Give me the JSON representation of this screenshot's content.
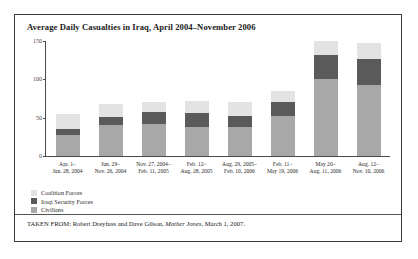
{
  "figure": {
    "title": "Average Daily Casualties in Iraq, April 2004–November 2006",
    "source_prefix": "TAKEN FROM: Robert Dreyfuss and Dave Gilson, ",
    "source_italic": "Mother Jones",
    "source_suffix": ", March 1, 2007."
  },
  "chart_data": {
    "type": "bar",
    "stacked": true,
    "title": "Average Daily Casualties in Iraq, April 2004–November 2006",
    "xlabel": "",
    "ylabel": "",
    "ylim": [
      0,
      150
    ],
    "yticks": [
      0,
      50,
      100,
      150
    ],
    "ytick_labels": [
      "0",
      "50",
      "100",
      "150"
    ],
    "grid": false,
    "legend_position": "below-left",
    "categories": [
      "Apr. 1–\nJun. 28, 2004",
      "Jun. 29–\nNov. 26, 2004",
      "Nov. 27, 2004–\nFeb. 11, 2005",
      "Feb. 12–\nAug. 28, 2005",
      "Aug. 29, 2005–\nFeb. 10, 2006",
      "Feb. 11–\nMay 19, 2006",
      "May 20–\nAug. 11, 2006",
      "Aug. 12–\nNov. 10, 2006"
    ],
    "category_lines": [
      [
        "Apr. 1–",
        "Jun. 28, 2004"
      ],
      [
        "Jun. 29–",
        "Nov. 26, 2004"
      ],
      [
        "Nov. 27, 2004–",
        "Feb. 11, 2005"
      ],
      [
        "Feb. 12–",
        "Aug. 28, 2005"
      ],
      [
        "Aug. 29, 2005–",
        "Feb. 10, 2006"
      ],
      [
        "Feb. 11–",
        "May 19, 2006"
      ],
      [
        "May 20–",
        "Aug. 11, 2006"
      ],
      [
        "Aug. 12–",
        "Nov. 10, 2006"
      ]
    ],
    "series": [
      {
        "name": "Civilians",
        "color": "#a8a8a8",
        "values": [
          27,
          40,
          42,
          38,
          38,
          52,
          100,
          93
        ]
      },
      {
        "name": "Iraqi Security Forces",
        "color": "#5a5a5a",
        "values": [
          8,
          11,
          16,
          18,
          14,
          18,
          32,
          33
        ]
      },
      {
        "name": "Coalition Forces",
        "color": "#e3e3e3",
        "values": [
          20,
          17,
          12,
          16,
          18,
          15,
          18,
          21
        ]
      }
    ],
    "totals": [
      55,
      68,
      70,
      72,
      70,
      85,
      150,
      147
    ],
    "legend": [
      {
        "label": "Coalition Forces",
        "color": "#e3e3e3"
      },
      {
        "label": "Iraqi Security Forces",
        "color": "#5a5a5a"
      },
      {
        "label": "Civilians",
        "color": "#a8a8a8"
      }
    ]
  }
}
